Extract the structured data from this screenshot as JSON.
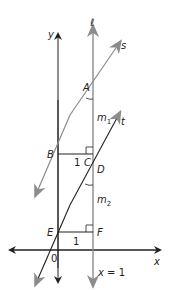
{
  "figure": {
    "type": "coordinate-geometry-diagram",
    "axes": {
      "x_label": "x",
      "y_label": "y",
      "origin_label": "0"
    },
    "lines": {
      "l_label": "ℓ",
      "l_equation": "x = 1",
      "s_label": "s",
      "t_label": "t"
    },
    "points": {
      "A": "A",
      "B": "B",
      "C": "C",
      "D": "D",
      "E": "E",
      "F": "F"
    },
    "segment_labels": {
      "BC": "1",
      "EF": "1"
    },
    "slope_labels": {
      "m1": "m",
      "m1_sub": "1",
      "m2": "m",
      "m2_sub": "2"
    },
    "colors": {
      "axes": "#231f20",
      "gray_lines": "#8a8c8e",
      "text": "#231f20"
    }
  }
}
